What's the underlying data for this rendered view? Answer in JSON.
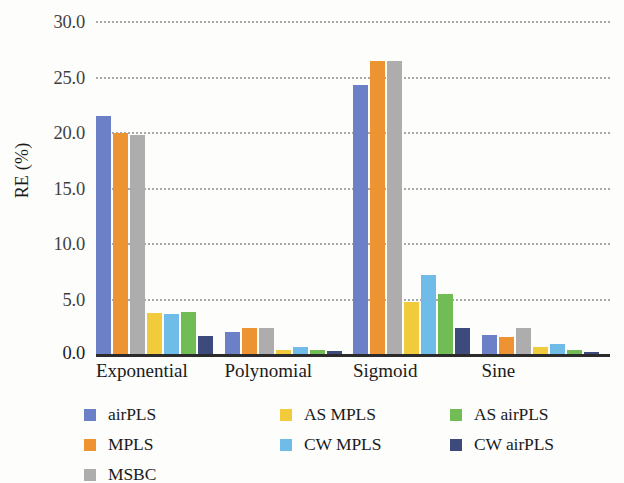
{
  "chart_data": {
    "type": "bar",
    "title": "",
    "xlabel": "",
    "ylabel": "RE (%)",
    "ylim": [
      0,
      30
    ],
    "yticks": [
      "0.0",
      "5.0",
      "10.0",
      "15.0",
      "20.0",
      "25.0",
      "30.0"
    ],
    "ytick_values": [
      0,
      5,
      10,
      15,
      20,
      25,
      30
    ],
    "grid": "horizontal-dotted",
    "legend_position": "bottom",
    "categories": [
      "Exponential",
      "Polynomial",
      "Sigmoid",
      "Sine"
    ],
    "series": [
      {
        "name": "airPLS",
        "color": "#6B80C6",
        "values": [
          21.4,
          2.0,
          24.2,
          1.7
        ]
      },
      {
        "name": "MPLS",
        "color": "#EE9332",
        "values": [
          19.9,
          2.3,
          26.4,
          1.5
        ]
      },
      {
        "name": "MSBC",
        "color": "#ADADAD",
        "values": [
          19.7,
          2.3,
          26.4,
          2.3
        ]
      },
      {
        "name": "AS MPLS",
        "color": "#F2CB3C",
        "values": [
          3.7,
          0.35,
          4.7,
          0.65
        ]
      },
      {
        "name": "CW MPLS",
        "color": "#70BCE8",
        "values": [
          3.6,
          0.6,
          7.1,
          0.9
        ]
      },
      {
        "name": "AS airPLS",
        "color": "#72BC55",
        "values": [
          3.8,
          0.4,
          5.4,
          0.35
        ]
      },
      {
        "name": "CW airPLS",
        "color": "#3C4A7C",
        "values": [
          1.6,
          0.25,
          2.3,
          0.2
        ]
      }
    ]
  },
  "legend_columns": [
    [
      "airPLS",
      "MPLS",
      "MSBC"
    ],
    [
      "AS MPLS",
      "CW MPLS"
    ],
    [
      "AS airPLS",
      "CW airPLS"
    ]
  ]
}
